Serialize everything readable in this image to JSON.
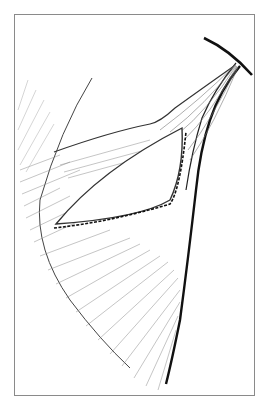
{
  "figure": {
    "type": "anatomical-line-drawing",
    "frame_color": "#8a8a8a",
    "line_color": "#222222",
    "hatch_color": "#7a7a7a",
    "background": "#ffffff"
  }
}
